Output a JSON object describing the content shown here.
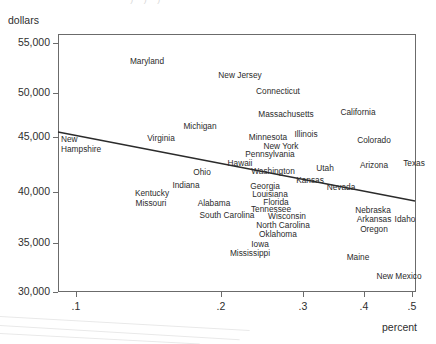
{
  "figure": {
    "top_clipped_text": "' ) ) )",
    "y_axis_title": "dollars",
    "x_axis_title": "percent"
  },
  "chart_data": {
    "type": "scatter",
    "title": "",
    "xlabel": "percent",
    "ylabel": "dollars",
    "xlim": [
      0.062,
      0.52
    ],
    "ylim": [
      29000,
      56000
    ],
    "xticks": [
      ".1",
      ".2",
      ".3",
      ".4",
      ".5"
    ],
    "xtick_values": [
      0.1,
      0.2,
      0.3,
      0.4,
      0.5
    ],
    "xtick_px": [
      76,
      221,
      303,
      364,
      412
    ],
    "yticks": [
      "55,000",
      "50,000",
      "45,000",
      "40,000",
      "35,000",
      "30,000"
    ],
    "ytick_values": [
      55000,
      50000,
      45000,
      40000,
      35000,
      30000
    ],
    "ytick_px": [
      43,
      93,
      137,
      192,
      243,
      292
    ],
    "grid": false,
    "legend": null,
    "point_style": "text-label",
    "fit_line": {
      "label": "linear fit",
      "x_start_px": 58,
      "y_start_px": 132,
      "x_end_px": 415,
      "y_end_px": 201,
      "y_at_x_start": 44300,
      "y_at_x_end": 38100
    },
    "points": [
      {
        "label": "Maryland",
        "x_px": 147,
        "y_px": 62
      },
      {
        "label": "New Jersey",
        "x_px": 240,
        "y_px": 76
      },
      {
        "label": "Connecticut",
        "x_px": 278,
        "y_px": 92
      },
      {
        "label": "Massachusetts",
        "x_px": 286,
        "y_px": 115
      },
      {
        "label": "California",
        "x_px": 358,
        "y_px": 113
      },
      {
        "label": "Michigan",
        "x_px": 200,
        "y_px": 127
      },
      {
        "label": "Virginia",
        "x_px": 161,
        "y_px": 139
      },
      {
        "label": "Minnesota",
        "x_px": 268,
        "y_px": 138
      },
      {
        "label": "Illinois",
        "x_px": 306,
        "y_px": 135
      },
      {
        "label": "Colorado",
        "x_px": 374,
        "y_px": 141
      },
      {
        "label": "New York",
        "x_px": 281,
        "y_px": 147
      },
      {
        "label": "Pennsylvania",
        "x_px": 270,
        "y_px": 155
      },
      {
        "label": "New Hampshire",
        "x_px": 61,
        "y_px": 144,
        "wrap": true
      },
      {
        "label": "Hawaii",
        "x_px": 240,
        "y_px": 164
      },
      {
        "label": "Washington",
        "x_px": 273,
        "y_px": 172
      },
      {
        "label": "Utah",
        "x_px": 325,
        "y_px": 169
      },
      {
        "label": "Arizona",
        "x_px": 374,
        "y_px": 166
      },
      {
        "label": "Texas",
        "x_px": 414,
        "y_px": 164
      },
      {
        "label": "Ohio",
        "x_px": 202,
        "y_px": 173
      },
      {
        "label": "Kansas",
        "x_px": 310,
        "y_px": 181
      },
      {
        "label": "Georgia",
        "x_px": 265,
        "y_px": 187
      },
      {
        "label": "Nevada",
        "x_px": 341,
        "y_px": 188
      },
      {
        "label": "Indiana",
        "x_px": 186,
        "y_px": 186
      },
      {
        "label": "Louisiana",
        "x_px": 270,
        "y_px": 195
      },
      {
        "label": "Kentucky",
        "x_px": 152,
        "y_px": 194
      },
      {
        "label": "Florida",
        "x_px": 276,
        "y_px": 203
      },
      {
        "label": "Missouri",
        "x_px": 151,
        "y_px": 204
      },
      {
        "label": "Alabama",
        "x_px": 214,
        "y_px": 204
      },
      {
        "label": "Tennessee",
        "x_px": 271,
        "y_px": 210
      },
      {
        "label": "Nebraska",
        "x_px": 373,
        "y_px": 211
      },
      {
        "label": "Wisconsin",
        "x_px": 287,
        "y_px": 217
      },
      {
        "label": "South Carolina",
        "x_px": 227,
        "y_px": 216
      },
      {
        "label": "Arkansas",
        "x_px": 374,
        "y_px": 220
      },
      {
        "label": "Idaho",
        "x_px": 405,
        "y_px": 220
      },
      {
        "label": "North Carolina",
        "x_px": 283,
        "y_px": 226
      },
      {
        "label": "Oregon",
        "x_px": 374,
        "y_px": 230
      },
      {
        "label": "Oklahoma",
        "x_px": 278,
        "y_px": 235
      },
      {
        "label": "Iowa",
        "x_px": 260,
        "y_px": 245
      },
      {
        "label": "Mississippi",
        "x_px": 250,
        "y_px": 254
      },
      {
        "label": "Maine",
        "x_px": 358,
        "y_px": 258
      },
      {
        "label": "New Mexico",
        "x_px": 399,
        "y_px": 277
      }
    ]
  }
}
